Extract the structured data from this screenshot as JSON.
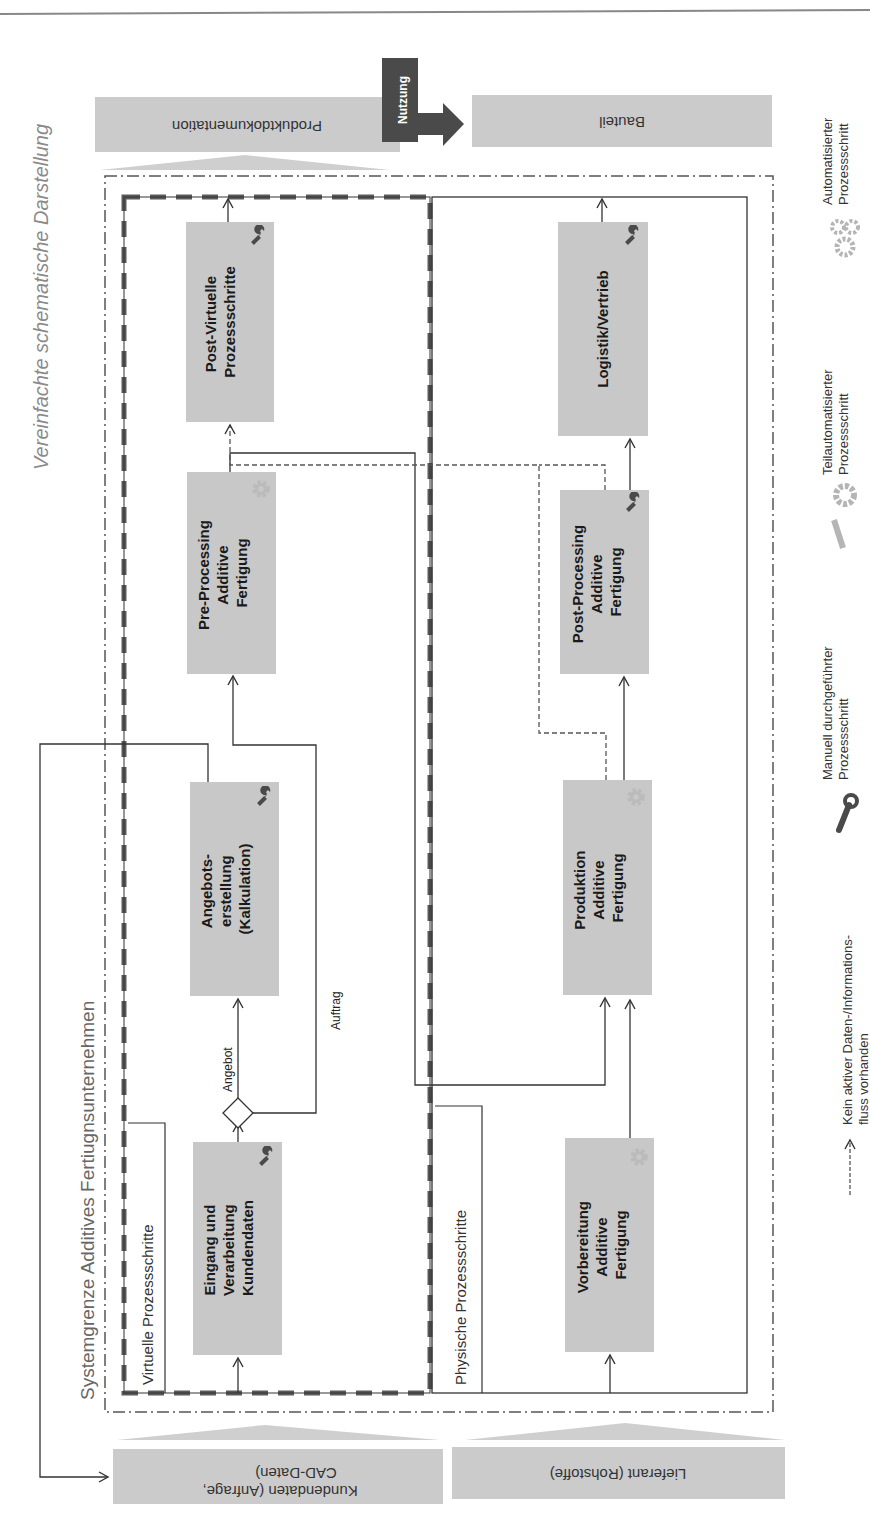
{
  "title": "Vereinfachte schematische Darstellung",
  "system_boundary_label": "Systemgrenze Additives Fertiugnsunternehmen",
  "lanes": {
    "virtual": "Virtuelle Prozessschritte",
    "physical": "Physische Prozessschritte"
  },
  "external": {
    "customer_data": {
      "line1": "Kundendaten (Anfrage,",
      "line2": "CAD-Daten)"
    },
    "supplier": "Lieferant (Rohstoffe)",
    "product_docs": "Produktdokumentation",
    "part": "Bauteil",
    "usage": "Nutzung"
  },
  "process_steps": {
    "eingang": {
      "lines": [
        "Eingang und",
        "Verarbeitung",
        "Kundendaten"
      ],
      "icon": "wrench"
    },
    "angebot": {
      "lines": [
        "Angebots-",
        "erstellung",
        "(Kalkulation)"
      ],
      "icon": "wrench"
    },
    "preprocessing": {
      "lines": [
        "Pre-Processing",
        "Additive",
        "Fertigung"
      ],
      "icon": "gear-wrench"
    },
    "postvirtual": {
      "lines": [
        "Post-Virtuelle",
        "Prozessschritte"
      ],
      "icon": "wrench"
    },
    "vorbereitung": {
      "lines": [
        "Vorbereitung",
        "Additive",
        "Fertigung"
      ],
      "icon": "gear-wrench"
    },
    "produktion": {
      "lines": [
        "Produktion",
        "Additive",
        "Fertigung"
      ],
      "icon": "gears"
    },
    "postprocessing": {
      "lines": [
        "Post-Processing",
        "Additive",
        "Fertigung"
      ],
      "icon": "wrench"
    },
    "logistik": {
      "lines": [
        "Logistik/Vertrieb"
      ],
      "icon": "wrench"
    }
  },
  "flow_labels": {
    "angebot": "Angebot",
    "auftrag": "Auftrag"
  },
  "legend": {
    "automated": {
      "line1": "Automatisierter",
      "line2": "Prozessschritt"
    },
    "semi_automated": {
      "line1": "Teilautomatisierter",
      "line2": "Prozessschritt"
    },
    "manual": {
      "line1": "Manuell durchgeführter",
      "line2": "Prozessschritt"
    },
    "no_flow": {
      "line1": "Kein aktiver Daten-/Informations-",
      "line2": "fluss vorhanden"
    }
  },
  "colors": {
    "box_fill": "#c8c8c8",
    "ext_fill": "#cbcbcb",
    "dark": "#444444",
    "icon_dark": "#4a4a4a",
    "icon_light": "#b8b8b8"
  }
}
